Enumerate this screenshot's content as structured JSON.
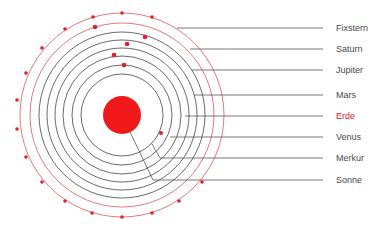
{
  "diagram": {
    "title": "",
    "center": {
      "x": 122,
      "y": 115
    },
    "colors": {
      "sun": "#f01818",
      "orbit_black": "#444444",
      "orbit_red": "#e04848",
      "planet": "#e0202a",
      "leader": "#555555",
      "label": "#4a4a4a",
      "label_highlight": "#e0202a"
    },
    "sun": {
      "label": "Sonne",
      "radius": 19
    },
    "orbits": [
      {
        "label": "Merkur",
        "radius": 41,
        "color": "black"
      },
      {
        "label": "Venus",
        "radius": 50,
        "color": "black"
      },
      {
        "label": "Erde",
        "radius": 59,
        "color": "black"
      },
      {
        "label": "Mars",
        "radius": 67,
        "color": "black"
      },
      {
        "label": "Jupiter",
        "radius": 75,
        "color": "black"
      },
      {
        "label": "Saturn",
        "radius": 83,
        "color": "black"
      },
      {
        "label": "Saturn",
        "radius": 92,
        "color": "red"
      },
      {
        "label": "Fixstern",
        "radius": 102,
        "color": "red"
      }
    ],
    "labels": [
      {
        "text": "Fixstern",
        "y": 28,
        "highlight": false
      },
      {
        "text": "Saturn",
        "y": 49,
        "highlight": false
      },
      {
        "text": "Jupiter",
        "y": 70,
        "highlight": false
      },
      {
        "text": "Mars",
        "y": 95,
        "highlight": false
      },
      {
        "text": "Erde",
        "y": 116,
        "highlight": true
      },
      {
        "text": "Venus",
        "y": 137,
        "highlight": false
      },
      {
        "text": "Merkur",
        "y": 158,
        "highlight": false
      },
      {
        "text": "Sonne",
        "y": 180,
        "highlight": false
      }
    ]
  }
}
